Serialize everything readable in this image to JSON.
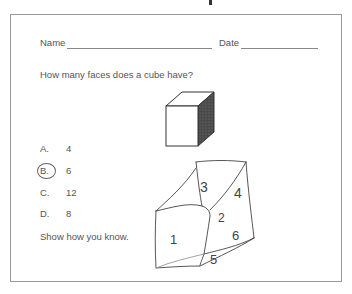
{
  "worksheet": {
    "name_label": "Name",
    "date_label": "Date",
    "question": "How many faces does a cube have?",
    "options": [
      {
        "letter": "A.",
        "value": "4",
        "selected": false
      },
      {
        "letter": "B.",
        "value": "6",
        "selected": true
      },
      {
        "letter": "C.",
        "value": "12",
        "selected": false
      },
      {
        "letter": "D.",
        "value": "8",
        "selected": false
      }
    ],
    "prompt": "Show how you know.",
    "sketch_labels": [
      "1",
      "2",
      "3",
      "4",
      "5",
      "6"
    ]
  }
}
